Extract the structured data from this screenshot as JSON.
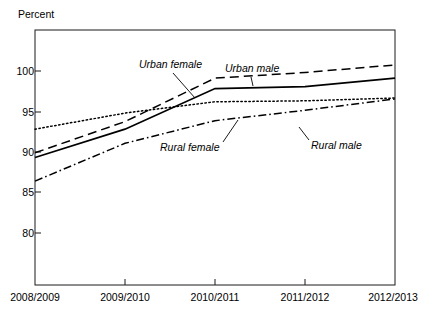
{
  "chart_data": {
    "type": "line",
    "title": "",
    "xlabel": "",
    "ylabel": "Percent",
    "categories": [
      "2008/2009",
      "2009/2010",
      "2010/2011",
      "2011/2012",
      "2012/2013"
    ],
    "ylim": [
      76.5,
      103.5
    ],
    "yticks": [
      80,
      85,
      90,
      95,
      100
    ],
    "ytick_labels": [
      "80",
      "85",
      "90",
      "95",
      "100"
    ],
    "grid": false,
    "legend_position": "inline-annotations",
    "series": [
      {
        "name": "Urban female",
        "style": "dashed",
        "values": [
          90.5,
          93.8,
          98.4,
          99.0,
          99.8
        ],
        "annotation": "Urban female"
      },
      {
        "name": "Urban male",
        "style": "solid",
        "values": [
          90.0,
          93.0,
          97.3,
          97.5,
          98.4
        ],
        "annotation": "Urban male"
      },
      {
        "name": "Rural female",
        "style": "dotted",
        "values": [
          93.0,
          94.7,
          95.9,
          96.0,
          96.3
        ],
        "annotation": "Rural female"
      },
      {
        "name": "Rural male",
        "style": "dash-dot",
        "values": [
          87.5,
          91.5,
          93.9,
          95.0,
          96.2
        ],
        "annotation": "Rural male"
      }
    ]
  },
  "labels": {
    "percent_axis_title": "Percent",
    "y_80": "80",
    "y_85": "85",
    "y_90": "90",
    "y_95": "95",
    "y_100": "100",
    "x_0": "2008/2009",
    "x_1": "2009/2010",
    "x_2": "2010/2011",
    "x_3": "2011/2012",
    "x_4": "2012/2013",
    "ann_urban_female": "Urban female",
    "ann_urban_male": "Urban male",
    "ann_rural_female": "Rural female",
    "ann_rural_male": "Rural male"
  },
  "colors": {
    "line": "#000000",
    "axis": "#1a1a1a",
    "background": "#ffffff"
  }
}
